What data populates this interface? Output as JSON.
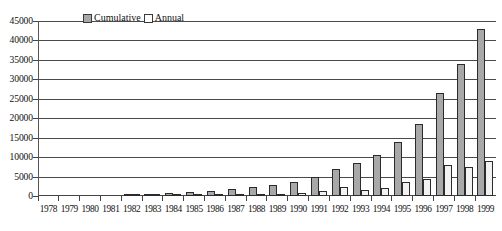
{
  "chart_data": {
    "type": "bar",
    "title": "",
    "xlabel": "",
    "ylabel": "",
    "ylim": [
      0,
      45000
    ],
    "ytick_step": 5000,
    "yticks": [
      45000,
      40000,
      35000,
      30000,
      25000,
      20000,
      15000,
      10000,
      5000,
      0
    ],
    "ytick_labels": [
      "45000",
      "40000",
      "35000",
      "30000",
      "25000",
      "20000",
      "15000",
      "10000",
      "5000",
      "0"
    ],
    "grid": "horizontal",
    "legend_position": "top-center",
    "categories": [
      "1978",
      "1979",
      "1980",
      "1981",
      "1982",
      "1983",
      "1984",
      "1985",
      "1986",
      "1987",
      "1988",
      "1989",
      "1990",
      "1991",
      "1992",
      "1993",
      "1994",
      "1995",
      "1996",
      "1997",
      "1998",
      "1999"
    ],
    "series": [
      {
        "name": "Cumulative",
        "color": "#a8a8a8",
        "values": [
          0,
          0,
          0,
          0,
          200,
          400,
          700,
          1000,
          1300,
          1700,
          2200,
          2800,
          3600,
          4800,
          7000,
          8500,
          10500,
          14000,
          18500,
          26500,
          34000,
          43000
        ]
      },
      {
        "name": "Annual",
        "color": "#f2f2f2",
        "values": [
          0,
          0,
          0,
          0,
          100,
          200,
          300,
          300,
          300,
          400,
          500,
          600,
          800,
          1200,
          2200,
          1500,
          2000,
          3500,
          4500,
          8000,
          7500,
          9000
        ]
      }
    ]
  },
  "legend": {
    "items": [
      {
        "label": "Cumulative",
        "swatch": "cumulative"
      },
      {
        "label": "Annual",
        "swatch": "annual"
      }
    ]
  }
}
